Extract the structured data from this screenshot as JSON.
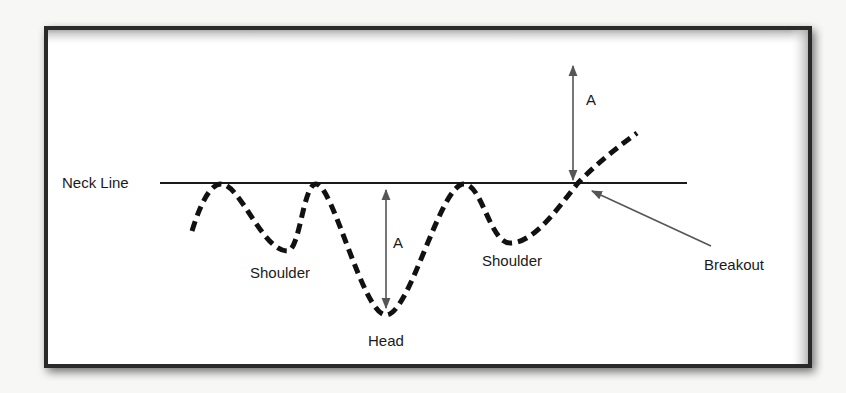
{
  "diagram": {
    "type": "inverse head and shoulders pattern",
    "labels": {
      "neck_line": "Neck Line",
      "left_shoulder": "Shoulder",
      "head": "Head",
      "right_shoulder": "Shoulder",
      "breakout": "Breakout",
      "head_depth": "A",
      "target_height": "A"
    },
    "colors": {
      "background": "#f7f7f6",
      "frame": "#2a2a2a",
      "line": "#1a1a1a",
      "arrow": "#555555",
      "text": "#1a1a1a"
    }
  }
}
